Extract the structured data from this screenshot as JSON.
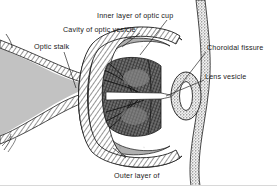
{
  "figure": {
    "type": "anatomical-line-diagram",
    "background_color": "#ffffff",
    "ink_color": "#1a1a1a",
    "tissue_fill_color": "#bdbdbd",
    "cavity_fill_color": "#a8a8a8",
    "inner_layer_color": "#3a3a3a"
  },
  "labels": {
    "inner_layer_of_optic_cup": "Inner layer of optic cup",
    "cavity_of_optic_vesicle": "Cavity of optic vesicle",
    "optic_stalk": "Optic stalk",
    "choroidal_fissure": "Choroidal fissure",
    "lens_vesicle": "Lens vesicle",
    "outer_layer_of_optic_cup_line1": "Outer layer of",
    "outer_layer_of_optic_cup_line2": "optic cup"
  },
  "structures": {
    "optic_stalk": "optic-stalk",
    "optic_cup_outer_layer": "optic-cup-outer-layer",
    "optic_cup_inner_layer": "optic-cup-inner-layer",
    "optic_vesicle_cavity": "optic-vesicle-cavity",
    "choroidal_fissure": "choroidal-fissure",
    "lens_vesicle": "lens-vesicle",
    "surface_ectoderm": "surface-ectoderm"
  }
}
